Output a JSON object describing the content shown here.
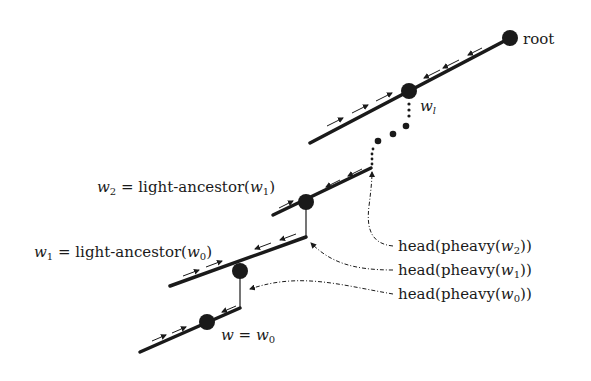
{
  "diagram": {
    "nodes": {
      "root": {
        "label": "root",
        "x": 510,
        "y": 38
      },
      "wl": {
        "label_var": "w",
        "label_sub": "l",
        "x": 409,
        "y": 91
      },
      "w2": {
        "x": 306,
        "y": 202
      },
      "w1": {
        "x": 240,
        "y": 271
      },
      "w0": {
        "x": 207,
        "y": 322
      }
    },
    "labels": {
      "w2_def": {
        "var": "w",
        "sub": "2",
        "text": " = light-ancestor(",
        "arg_var": "w",
        "arg_sub": "1",
        "close": ")"
      },
      "w1_def": {
        "var": "w",
        "sub": "1",
        "text": " = light-ancestor(",
        "arg_var": "w",
        "arg_sub": "0",
        "close": ")"
      },
      "w0_def": {
        "var": "w",
        "eq": " = ",
        "var2": "w",
        "sub2": "0"
      },
      "wl": {
        "var": "w",
        "sub": "l"
      },
      "root": "root"
    },
    "head_labels": [
      {
        "prefix": "head(pheavy(",
        "var": "w",
        "sub": "2",
        "suffix": "))"
      },
      {
        "prefix": "head(pheavy(",
        "var": "w",
        "sub": "1",
        "suffix": "))"
      },
      {
        "prefix": "head(pheavy(",
        "var": "w",
        "sub": "0",
        "suffix": "))"
      }
    ],
    "colors": {
      "edge": "#1a1a1a",
      "node": "#1a1a1a",
      "text": "#1a1a1a",
      "background": "#ffffff"
    }
  }
}
